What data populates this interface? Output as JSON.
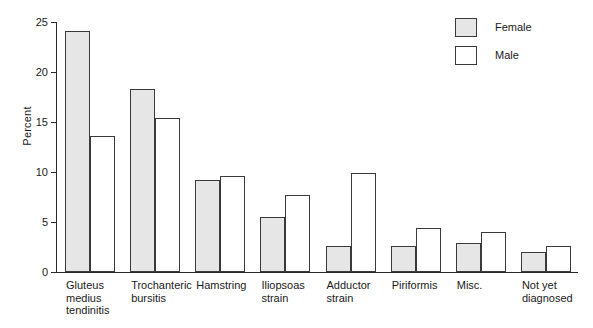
{
  "chart_data": {
    "type": "bar",
    "title": "",
    "subtitle": "",
    "xlabel": "",
    "ylabel": "Percent",
    "ylim": [
      0,
      25
    ],
    "yticks": [
      0,
      5,
      10,
      15,
      20,
      25
    ],
    "grid": false,
    "legend_position": "top-right",
    "categories": [
      "Gluteus\nmedius\ntendinitis",
      "Trochanteric\nbursitis",
      "Hamstring",
      "Iliopsoas\nstrain",
      "Adductor\nstrain",
      "Piriformis",
      "Misc.",
      "Not yet\ndiagnosed"
    ],
    "series": [
      {
        "name": "Female",
        "color": "#e6e6e6",
        "values": [
          24.1,
          18.3,
          9.2,
          5.5,
          2.6,
          2.6,
          2.9,
          2.0
        ]
      },
      {
        "name": "Male",
        "color": "#ffffff",
        "values": [
          13.6,
          15.4,
          9.6,
          7.7,
          9.9,
          4.4,
          4.0,
          2.6
        ]
      }
    ]
  },
  "axis": {
    "y_title": "Percent",
    "y_tick_labels": [
      "0",
      "5",
      "10",
      "15",
      "20",
      "25"
    ]
  },
  "legend": {
    "entries": [
      {
        "label": "Female",
        "swatch": "filled-gray"
      },
      {
        "label": "Male",
        "swatch": "unfilled-white"
      }
    ]
  },
  "colors": {
    "bar_female_fill": "#e6e6e6",
    "bar_male_fill": "#ffffff",
    "bar_stroke": "#3a3a3a",
    "axis": "#2a2a2a",
    "text": "#1a1a1a",
    "background": "#ffffff"
  }
}
